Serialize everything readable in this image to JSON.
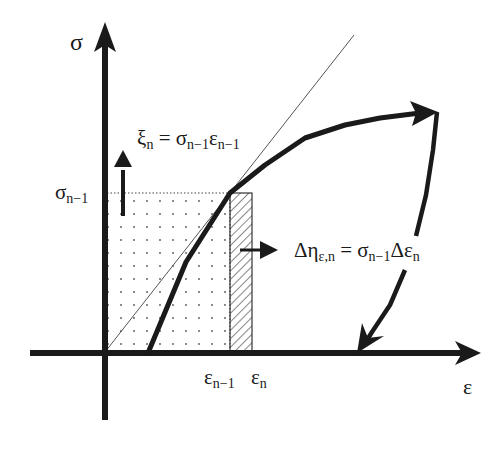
{
  "diagram": {
    "type": "stress-strain diagram",
    "axes": {
      "y_label": "σ",
      "x_label": "ε"
    },
    "ticks": {
      "y_tick": {
        "main": "σ",
        "sub": "n−1"
      },
      "x_ticks": [
        {
          "main": "ε",
          "sub": "n−1"
        },
        {
          "main": "ε",
          "sub": "n"
        }
      ]
    },
    "equations": {
      "xi": {
        "lhs_main": "ξ",
        "lhs_sub": "n",
        "eq": " = ",
        "t1_main": "σ",
        "t1_sub": "n−1",
        "t2_main": "ε",
        "t2_sub": "n−1"
      },
      "eta": {
        "lhs_main": "Δη",
        "lhs_sub": "ε,n",
        "eq": " = ",
        "t1_main": "σ",
        "t1_sub": "n−1",
        "t2_main": "Δε",
        "t2_sub": "n"
      }
    },
    "regions": [
      {
        "name": "dotted-area",
        "pattern": "dots",
        "meaning": "complementary energy rectangle σn−1·εn−1"
      },
      {
        "name": "hatched-strip",
        "pattern": "diagonal-hatch",
        "meaning": "increment σn−1·Δεn"
      }
    ],
    "colors": {
      "ink": "#1a1a1a",
      "background": "#ffffff"
    }
  }
}
